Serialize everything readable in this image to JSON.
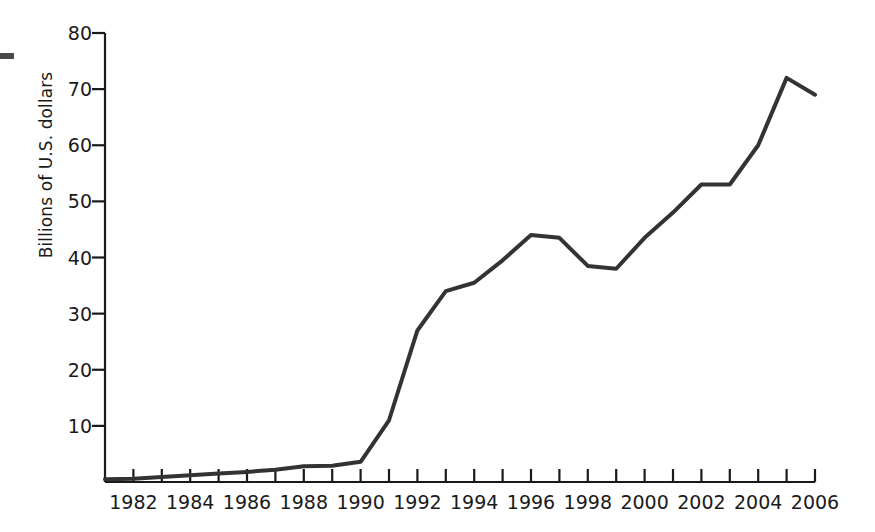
{
  "chart_data": {
    "type": "line",
    "title": "",
    "subtitle": "",
    "xlabel": "",
    "ylabel": "Billions of U.S. dollars",
    "xlim": [
      1981,
      2006
    ],
    "ylim": [
      0,
      80
    ],
    "grid": false,
    "legend": null,
    "y_ticks": [
      0,
      10,
      20,
      30,
      40,
      50,
      60,
      70,
      80
    ],
    "y_tick_labels": [
      "",
      "10",
      "20",
      "30",
      "40",
      "50",
      "60",
      "70",
      "80"
    ],
    "x_ticks": [
      1981,
      1982,
      1983,
      1984,
      1985,
      1986,
      1987,
      1988,
      1989,
      1990,
      1991,
      1992,
      1993,
      1994,
      1995,
      1996,
      1997,
      1998,
      1999,
      2000,
      2001,
      2002,
      2003,
      2004,
      2005,
      2006
    ],
    "x_tick_labels": [
      "1982",
      "1984",
      "1986",
      "1988",
      "1990",
      "1992",
      "1994",
      "1996",
      "1998",
      "2000",
      "2002",
      "2004",
      "2006"
    ],
    "x_tick_label_years": [
      1982,
      1984,
      1986,
      1988,
      1990,
      1992,
      1994,
      1996,
      1998,
      2000,
      2002,
      2004,
      2006
    ],
    "x": [
      1981,
      1982,
      1983,
      1984,
      1985,
      1986,
      1987,
      1988,
      1989,
      1990,
      1991,
      1992,
      1993,
      1994,
      1995,
      1996,
      1997,
      1998,
      1999,
      2000,
      2001,
      2002,
      2003,
      2004,
      2005,
      2006
    ],
    "values": [
      0.5,
      0.6,
      0.9,
      1.2,
      1.5,
      1.8,
      2.2,
      2.8,
      2.9,
      3.6,
      11.0,
      27.0,
      34.0,
      35.5,
      39.5,
      44.0,
      43.5,
      38.5,
      38.0,
      43.5,
      48.0,
      53.0,
      53.0,
      60.0,
      72.0,
      69.0
    ],
    "series": [
      {
        "name": "Billions of U.S. dollars",
        "color": "#333333",
        "line_width": 4,
        "values": [
          0.5,
          0.6,
          0.9,
          1.2,
          1.5,
          1.8,
          2.2,
          2.8,
          2.9,
          3.6,
          11.0,
          27.0,
          34.0,
          35.5,
          39.5,
          44.0,
          43.5,
          38.5,
          38.0,
          43.5,
          48.0,
          53.0,
          53.0,
          60.0,
          72.0,
          69.0
        ]
      }
    ],
    "annotations": []
  },
  "axes": {
    "spine_color": "#1a1a1a",
    "tick_color": "#1a1a1a",
    "background": "#ffffff"
  },
  "marks": {
    "crop_mark_name": "crop-mark"
  }
}
